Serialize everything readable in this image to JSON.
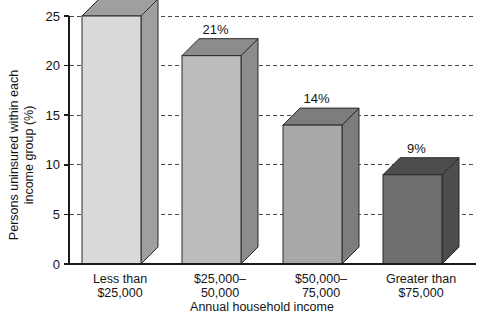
{
  "chart_data": {
    "type": "bar",
    "title": "",
    "subtitle": "",
    "xlabel": "Annual household income",
    "ylabel": "Persons uninsured within each income group (%)",
    "ylabel_lines": [
      "Persons uninsured within each",
      "income group (%)"
    ],
    "categories": [
      "Less than $25,000",
      "$25,000– 50,000",
      "$50,000– 75,000",
      "Greater than $75,000"
    ],
    "category_lines": [
      [
        "Less than",
        "$25,000"
      ],
      [
        "$25,000–",
        "50,000"
      ],
      [
        "$50,000–",
        "75,000"
      ],
      [
        "Greater than",
        "$75,000"
      ]
    ],
    "values": [
      25,
      21,
      14,
      9
    ],
    "data_labels": [
      "25%",
      "21%",
      "14%",
      "9%"
    ],
    "ylim": [
      0,
      25
    ],
    "yticks": [
      0,
      5,
      10,
      15,
      20,
      25
    ],
    "ytick_labels": [
      "0",
      "5",
      "10",
      "15",
      "20",
      "25"
    ],
    "grid": true,
    "grid_axis": "y",
    "legend": "none",
    "style": "3d-bars",
    "bar_colors": [
      "#d9d9d9",
      "#bcbcbc",
      "#a9a9a9",
      "#6e6e6e"
    ],
    "bar_side_colors": [
      "#9f9f9f",
      "#8c8c8c",
      "#7d7d7d",
      "#4d4d4d"
    ],
    "bar_outline_color": "#2a2a2a",
    "axis_color": "#1a1a1a",
    "grid_color": "#4a4a4a",
    "background_color": "#ffffff"
  }
}
